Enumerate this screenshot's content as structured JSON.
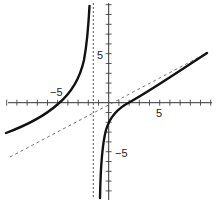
{
  "chart_data": {
    "type": "line",
    "title": "",
    "xlabel": "",
    "ylabel": "",
    "xlim": [
      -10,
      10
    ],
    "ylim": [
      -9.5,
      10
    ],
    "x_tick_labels": [
      "-5",
      "5"
    ],
    "y_tick_labels": [
      "5",
      "-5"
    ],
    "x_ticks": [
      -10,
      -9,
      -8,
      -7,
      -6,
      -5,
      -4,
      -3,
      -2,
      -1,
      1,
      2,
      3,
      4,
      5,
      6,
      7,
      8,
      9,
      10
    ],
    "y_ticks": [
      -9,
      -8,
      -7,
      -6,
      -5,
      -4,
      -3,
      -2,
      -1,
      1,
      2,
      3,
      4,
      5,
      6,
      7,
      8,
      9,
      10
    ],
    "grid": false,
    "series": [
      {
        "name": "rational function (left branch)",
        "style": "solid",
        "points": [
          [
            -10.1,
            -3.0
          ],
          [
            -8,
            -2.0
          ],
          [
            -6,
            -0.9
          ],
          [
            -4.3,
            0
          ],
          [
            -3,
            1.5
          ],
          [
            -2.5,
            3.0
          ],
          [
            -2.1,
            5.5
          ],
          [
            -1.9,
            10.0
          ]
        ]
      },
      {
        "name": "rational function (right branch)",
        "style": "solid",
        "points": [
          [
            -0.8,
            -9.7
          ],
          [
            -0.6,
            -6.0
          ],
          [
            -0.2,
            -3.0
          ],
          [
            0.5,
            -1.2
          ],
          [
            2.1,
            0
          ],
          [
            4,
            1.3
          ],
          [
            6,
            2.5
          ],
          [
            9.6,
            5.1
          ]
        ]
      },
      {
        "name": "oblique asymptote",
        "style": "dashed",
        "points": [
          [
            -9.7,
            -5.6
          ],
          [
            9.6,
            5.1
          ]
        ]
      },
      {
        "name": "vertical asymptote",
        "style": "dotted",
        "x": -1.5
      }
    ]
  },
  "axes": {
    "x_label_neg": "−5",
    "x_label_pos": "5",
    "y_label_pos": "5",
    "y_label_neg": "−5"
  }
}
